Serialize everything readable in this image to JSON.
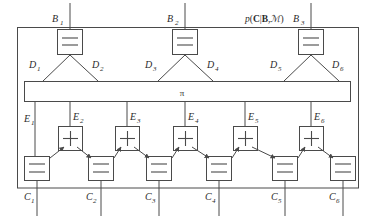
{
  "figure": {
    "title_annotation": "p(C|B,M)",
    "annotation_parts": {
      "p": "p",
      "open": "(",
      "C": "C",
      "bar": "|",
      "B": "B",
      "comma": ",",
      "M": "ℳ",
      "close": ")"
    },
    "permutation_node_label": "π",
    "equality_glyph": "=",
    "adder_glyph": "+"
  },
  "top_nodes": [
    {
      "label": "B",
      "sub": "1",
      "type": "equality",
      "x": 70
    },
    {
      "label": "B",
      "sub": "2",
      "type": "equality",
      "x": 185
    },
    {
      "label": "B",
      "sub": "3",
      "type": "equality",
      "x": 311
    }
  ],
  "middle_edges": [
    {
      "label": "D",
      "sub": "1"
    },
    {
      "label": "D",
      "sub": "2"
    },
    {
      "label": "D",
      "sub": "3"
    },
    {
      "label": "D",
      "sub": "4"
    },
    {
      "label": "D",
      "sub": "5"
    },
    {
      "label": "D",
      "sub": "6"
    }
  ],
  "adder_edges": [
    {
      "label": "E",
      "sub": "1"
    },
    {
      "label": "E",
      "sub": "2"
    },
    {
      "label": "E",
      "sub": "3"
    },
    {
      "label": "E",
      "sub": "4"
    },
    {
      "label": "E",
      "sub": "5"
    },
    {
      "label": "E",
      "sub": "6"
    }
  ],
  "bottom_nodes": [
    {
      "label": "C",
      "sub": "1",
      "type": "equality"
    },
    {
      "label": "C",
      "sub": "2",
      "type": "equality"
    },
    {
      "label": "C",
      "sub": "3",
      "type": "equality"
    },
    {
      "label": "C",
      "sub": "4",
      "type": "equality"
    },
    {
      "label": "C",
      "sub": "5",
      "type": "equality"
    },
    {
      "label": "C",
      "sub": "6",
      "type": "equality"
    }
  ],
  "adder_nodes": [
    {
      "type": "adder",
      "index": 2
    },
    {
      "type": "adder",
      "index": 3
    },
    {
      "type": "adder",
      "index": 4
    },
    {
      "type": "adder",
      "index": 5
    },
    {
      "type": "adder",
      "index": 6
    }
  ],
  "colors": {
    "stroke": "#4a4a4a",
    "text": "#2b2b2b",
    "background": "#ffffff"
  }
}
